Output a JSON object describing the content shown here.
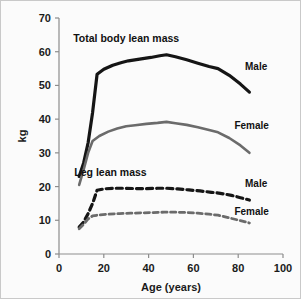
{
  "chart_data": {
    "type": "line",
    "title": "",
    "xlabel": "Age (years)",
    "ylabel": "kg",
    "xlim": [
      0,
      100
    ],
    "ylim": [
      0,
      70
    ],
    "xticks": [
      0,
      20,
      40,
      60,
      80,
      100
    ],
    "yticks": [
      0,
      10,
      20,
      30,
      40,
      50,
      60,
      70
    ],
    "grid": false,
    "legend_position": "inline-right",
    "annotations": [
      {
        "text": "Total body lean mass",
        "x": 30,
        "y": 63
      },
      {
        "text": "Leg lean mass",
        "x": 23,
        "y": 23
      }
    ],
    "series": [
      {
        "name": "Total body lean mass - Male",
        "label": "Male",
        "color": "#151515",
        "style": "solid",
        "width": 3.2,
        "x": [
          9,
          11,
          13,
          15,
          17,
          20,
          24,
          28,
          31,
          36,
          41,
          45,
          48,
          52,
          57,
          62,
          67,
          71,
          76,
          81,
          85
        ],
        "y": [
          23.0,
          27.0,
          33.0,
          42.0,
          53.3,
          54.8,
          56.0,
          56.8,
          57.3,
          57.8,
          58.3,
          58.8,
          59.1,
          58.5,
          57.6,
          56.6,
          55.6,
          55.0,
          53.0,
          50.4,
          48.0
        ]
      },
      {
        "name": "Total body lean mass - Female",
        "label": "Female",
        "color": "#6b6b6b",
        "style": "solid",
        "width": 2.6,
        "x": [
          9,
          11,
          13,
          15,
          18,
          22,
          26,
          30,
          34,
          39,
          44,
          48,
          52,
          57,
          62,
          67,
          71,
          76,
          81,
          85
        ],
        "y": [
          20.5,
          25.0,
          30.0,
          33.5,
          35.0,
          36.3,
          37.2,
          37.9,
          38.2,
          38.6,
          38.9,
          39.2,
          38.8,
          38.3,
          37.6,
          36.8,
          36.1,
          34.4,
          32.2,
          30.0
        ]
      },
      {
        "name": "Leg lean mass - Male",
        "label": "Male",
        "color": "#151515",
        "style": "dashed",
        "width": 3.2,
        "x": [
          9,
          11,
          13,
          15,
          17,
          20,
          24,
          29,
          34,
          39,
          44,
          48,
          53,
          58,
          63,
          68,
          72,
          77,
          81,
          85
        ],
        "y": [
          8.0,
          9.5,
          12.0,
          15.0,
          18.9,
          19.3,
          19.5,
          19.5,
          19.4,
          19.4,
          19.5,
          19.5,
          19.3,
          19.0,
          18.7,
          18.3,
          18.0,
          17.4,
          16.7,
          16.0
        ]
      },
      {
        "name": "Leg lean mass - Female",
        "label": "Female",
        "color": "#6b6b6b",
        "style": "dashed",
        "width": 2.8,
        "x": [
          9,
          11,
          13,
          15,
          18,
          22,
          27,
          32,
          37,
          42,
          47,
          52,
          57,
          62,
          67,
          71,
          76,
          81,
          85
        ],
        "y": [
          7.5,
          8.8,
          10.4,
          11.3,
          11.6,
          11.8,
          12.0,
          12.1,
          12.2,
          12.3,
          12.4,
          12.4,
          12.3,
          12.1,
          11.8,
          11.5,
          10.7,
          9.9,
          9.2
        ]
      }
    ],
    "series_labels": [
      {
        "text": "Male",
        "x": 88,
        "y": 54.5
      },
      {
        "text": "Female",
        "x": 86,
        "y": 37.0
      },
      {
        "text": "Male",
        "x": 88,
        "y": 20.0
      },
      {
        "text": "Female",
        "x": 86,
        "y": 11.6
      }
    ]
  },
  "axes": {
    "y_label": "kg",
    "x_label": "Age (years)",
    "y_tick_labels": [
      "0",
      "10",
      "20",
      "30",
      "40",
      "50",
      "60",
      "70"
    ],
    "x_tick_labels": [
      "0",
      "20",
      "40",
      "60",
      "80",
      "100"
    ]
  },
  "colors": {
    "male": "#151515",
    "female": "#6b6b6b",
    "axis": "#8d8d8d",
    "background": "#fbfbfb",
    "border": "#c9c9c9"
  }
}
